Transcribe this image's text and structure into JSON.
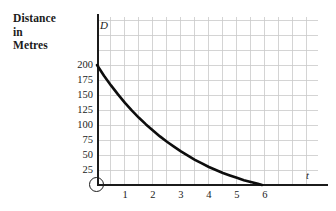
{
  "figure": {
    "axis_title_lines": [
      "Distance",
      "in",
      "Metres"
    ],
    "y_axis_symbol": "D",
    "x_axis_symbol": "t",
    "origin_symbol": "O"
  },
  "colors": {
    "grid": "#c9c9c9",
    "axis": "#1b1b1b",
    "curve": "#0d0d0d",
    "text": "#1b1b1b",
    "background": "#ffffff"
  },
  "chart_data": {
    "type": "line",
    "title": "Distance in Metres",
    "xlabel": "t",
    "ylabel": "D",
    "grid": true,
    "legend": "none",
    "xlim": [
      0,
      7.9
    ],
    "ylim": [
      0,
      280
    ],
    "x_ticks": [
      1,
      2,
      3,
      4,
      5,
      6
    ],
    "x_tick_labels": [
      "1",
      "2",
      "3",
      "4",
      "5",
      "6"
    ],
    "y_ticks": [
      25,
      50,
      75,
      100,
      125,
      150,
      175,
      200
    ],
    "y_tick_labels": [
      "25",
      "50",
      "75",
      "100",
      "125",
      "150",
      "175",
      "200"
    ],
    "x_minor_step": 0.5,
    "y_minor_step": 25,
    "series": [
      {
        "name": "D",
        "x": [
          0,
          0.25,
          0.5,
          0.75,
          1,
          1.25,
          1.5,
          1.75,
          2,
          2.25,
          2.5,
          2.75,
          3,
          3.25,
          3.5,
          3.75,
          4,
          4.25,
          4.5,
          4.75,
          5,
          5.25,
          5.5,
          5.75,
          5.9
        ],
        "values": [
          200,
          182,
          166,
          151,
          137,
          124,
          112,
          101,
          91,
          81,
          72,
          64,
          56,
          49,
          42,
          36,
          30,
          25,
          20,
          16,
          12,
          8,
          5,
          2,
          0
        ]
      }
    ],
    "annotations": [
      {
        "text": "O",
        "x": 0,
        "y": 0,
        "role": "origin-label"
      },
      {
        "text": "D",
        "x": 0.12,
        "y": 265,
        "role": "y-axis-label"
      },
      {
        "text": "t",
        "x": 7.5,
        "y": 18,
        "role": "x-axis-label"
      }
    ]
  }
}
